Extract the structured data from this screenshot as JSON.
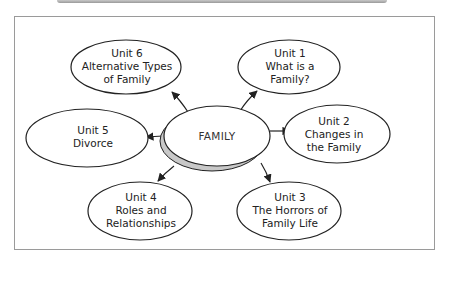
{
  "diagram": {
    "center": {
      "label": "FAMILY"
    },
    "nodes": [
      {
        "id": "unit6",
        "title": "Unit 6",
        "lines": [
          "Alternative Types",
          "of Family"
        ]
      },
      {
        "id": "unit1",
        "title": "Unit 1",
        "lines": [
          "What is a",
          "Family?"
        ]
      },
      {
        "id": "unit5",
        "title": "Unit 5",
        "lines": [
          "Divorce"
        ]
      },
      {
        "id": "unit2",
        "title": "Unit 2",
        "lines": [
          "Changes in",
          "the Family"
        ]
      },
      {
        "id": "unit4",
        "title": "Unit 4",
        "lines": [
          "Roles and",
          "Relationships"
        ]
      },
      {
        "id": "unit3",
        "title": "Unit 3",
        "lines": [
          "The Horrors of",
          "Family Life"
        ]
      }
    ]
  },
  "colors": {
    "stroke": "#222222",
    "shadow": "#c8c8c8",
    "frame": "#9a9a9a"
  }
}
